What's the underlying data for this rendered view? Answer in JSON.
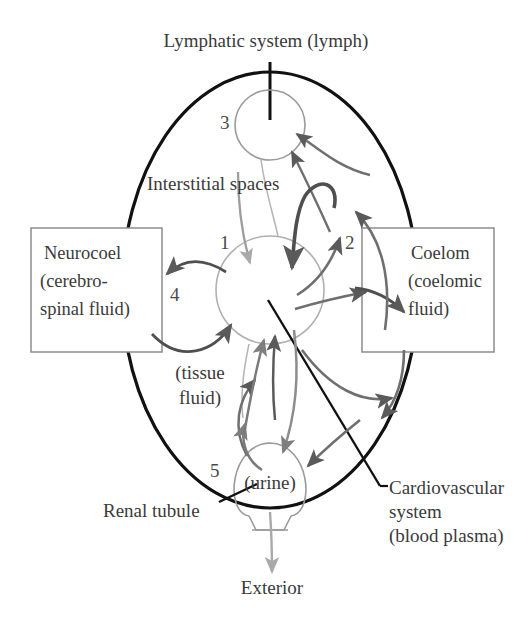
{
  "figure": {
    "title_text": "Lymphatic system (lymph)",
    "kind": "biological fluid compartment diagram"
  },
  "colors": {
    "outer_body_outline": "#111111",
    "compartment_circle": "#9a9a9a",
    "arrow_dark": "#5a5a5a",
    "arrow_mid": "#7e7e7e",
    "arrow_light": "#a9a9a9",
    "box_border": "#8d8d8d",
    "text": "#3a3a3a",
    "background": "#ffffff"
  },
  "labels": {
    "lymphatic_system": "Lymphatic system (lymph)",
    "interstitial_spaces": "Interstitial spaces",
    "tissue_fluid_line1": "(tissue",
    "tissue_fluid_line2": "fluid)",
    "urine": "(urine)",
    "renal_tubule": "Renal tubule",
    "cardiovascular_line1": "Cardiovascular",
    "cardiovascular_line2": "system",
    "cardiovascular_line3": "(blood plasma)",
    "exterior": "Exterior"
  },
  "boxes": {
    "neurocoel": {
      "line1": "Neurocoel",
      "line2": "(cerebro-",
      "line3": "spinal fluid)"
    },
    "coelom": {
      "line1": "Coelom",
      "line2": "(coelomic",
      "line3": "fluid)"
    }
  },
  "numbers": {
    "n1": "1",
    "n2": "2",
    "n3": "3",
    "n4": "4",
    "n5": "5"
  },
  "compartments": [
    {
      "number": "1",
      "name": "Interstitial spaces",
      "fluid": "tissue fluid"
    },
    {
      "number": "2",
      "name": "Coelom",
      "fluid": "coelomic fluid"
    },
    {
      "number": "3",
      "name": "Lymphatic system",
      "fluid": "lymph"
    },
    {
      "number": "4",
      "name": "Neurocoel",
      "fluid": "cerebrospinal fluid"
    },
    {
      "number": "5",
      "name": "Renal tubule",
      "fluid": "urine"
    }
  ]
}
